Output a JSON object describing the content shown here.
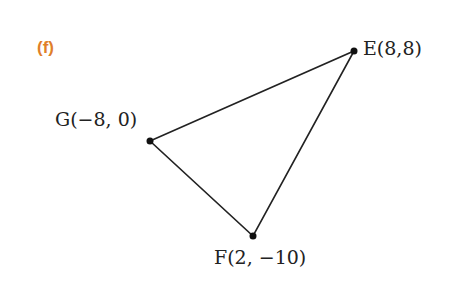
{
  "part_label": "(f)",
  "accent_color": "#e07f2a",
  "points": [
    {
      "name": "E",
      "label": "E(8,8)",
      "x": 8,
      "y": 8
    },
    {
      "name": "G",
      "label": "G(−8, 0)",
      "x": -8,
      "y": 0
    },
    {
      "name": "F",
      "label": "F(2, −10)",
      "x": 2,
      "y": -10
    }
  ],
  "shape": "triangle EFG"
}
